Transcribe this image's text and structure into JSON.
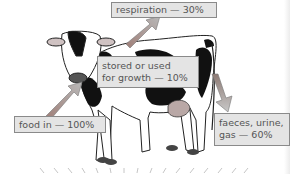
{
  "diagram": {
    "labels": {
      "respiration": "respiration — 30%",
      "stored_line1": "stored or used",
      "stored_line2": "for growth — 10%",
      "food_in": "food in — 100%",
      "waste_line1": "faeces, urine,",
      "waste_line2": "gas — 60%"
    },
    "flows": [
      {
        "name": "food in",
        "percent": 100,
        "direction": "into mouth"
      },
      {
        "name": "respiration",
        "percent": 30,
        "direction": "out of back"
      },
      {
        "name": "stored or used for growth",
        "percent": 10,
        "direction": "retained in body"
      },
      {
        "name": "faeces, urine, gas",
        "percent": 60,
        "direction": "out of rear"
      }
    ],
    "colors": {
      "label_bg": "#e4e4e4",
      "label_border": "#8a8a8a",
      "label_text": "#555555",
      "arrow_fill": "#9a8a84",
      "cow_patch": "#111111",
      "udder": "#b9a8a6"
    }
  }
}
